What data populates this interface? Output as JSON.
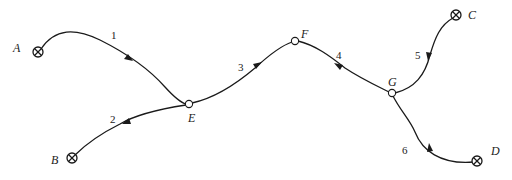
{
  "diagram": {
    "type": "directed network",
    "colors": {
      "stroke": "#1a1a1a",
      "background": "#ffffff"
    },
    "terminals": [
      {
        "id": "A",
        "label": "A",
        "icon": "crossed-circle-icon"
      },
      {
        "id": "B",
        "label": "B",
        "icon": "crossed-circle-icon"
      },
      {
        "id": "C",
        "label": "C",
        "icon": "crossed-circle-icon"
      },
      {
        "id": "D",
        "label": "D",
        "icon": "crossed-circle-icon"
      }
    ],
    "junctions": [
      {
        "id": "E",
        "label": "E",
        "icon": "open-circle-icon"
      },
      {
        "id": "F",
        "label": "F",
        "icon": "open-circle-icon"
      },
      {
        "id": "G",
        "label": "G",
        "icon": "open-circle-icon"
      }
    ],
    "edges": [
      {
        "label": "1",
        "from": "A",
        "to": "E"
      },
      {
        "label": "2",
        "from": "E",
        "to": "B"
      },
      {
        "label": "3",
        "from": "E",
        "to": "F"
      },
      {
        "label": "4",
        "from": "G",
        "to": "F"
      },
      {
        "label": "5",
        "from": "C",
        "to": "G"
      },
      {
        "label": "6",
        "from": "D",
        "to": "G"
      }
    ]
  }
}
